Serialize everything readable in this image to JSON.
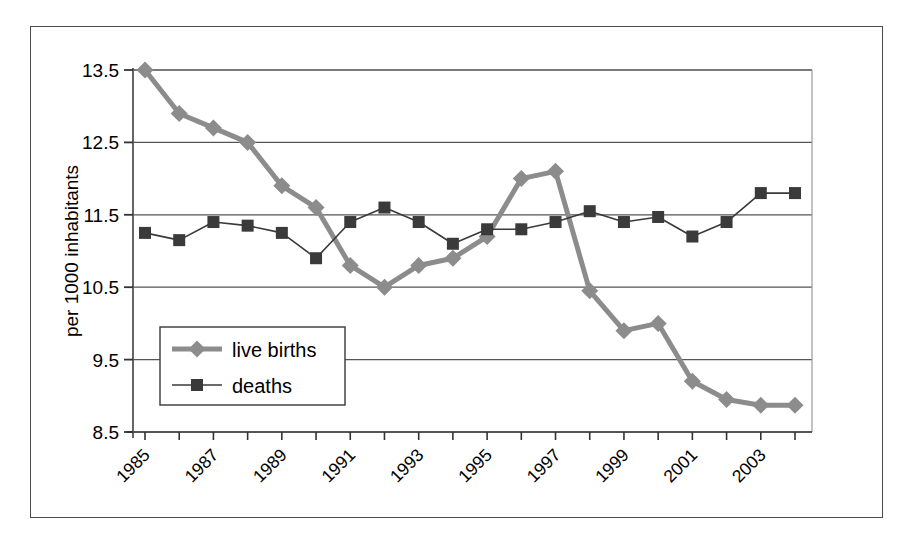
{
  "chart_data": {
    "type": "line",
    "title": "",
    "xlabel": "",
    "ylabel": "per 1000 inhabitants",
    "ylim": [
      8.5,
      13.5
    ],
    "yticks": [
      "13.5",
      "12.5",
      "11.5",
      "10.5",
      "9.5",
      "8.5"
    ],
    "ytick_values": [
      13.5,
      12.5,
      11.5,
      10.5,
      9.5,
      8.5
    ],
    "grid": true,
    "legend_position": "inside lower-left",
    "x": [
      1985,
      1986,
      1987,
      1988,
      1989,
      1990,
      1991,
      1992,
      1993,
      1994,
      1995,
      1996,
      1997,
      1998,
      1999,
      2000,
      2001,
      2002,
      2003,
      2004
    ],
    "xtick_labels": [
      "1985",
      "",
      "1987",
      "",
      "1989",
      "",
      "1991",
      "",
      "1993",
      "",
      "1995",
      "",
      "1997",
      "",
      "1999",
      "",
      "2001",
      "",
      "2003",
      ""
    ],
    "xticks_shown": [
      "1985",
      "1987",
      "1989",
      "1991",
      "1993",
      "1995",
      "1997",
      "1999",
      "2001",
      "2003"
    ],
    "series": [
      {
        "name": "live births",
        "color": "#8c8c8c",
        "marker": "diamond",
        "linewidth": 5,
        "values": [
          13.5,
          12.9,
          12.7,
          12.5,
          11.9,
          11.6,
          10.8,
          10.5,
          10.8,
          10.9,
          11.2,
          12.0,
          12.1,
          10.45,
          9.9,
          10.0,
          9.2,
          8.95,
          8.87,
          8.87
        ]
      },
      {
        "name": "deaths",
        "color": "#3a3a3a",
        "marker": "square",
        "linewidth": 1.6,
        "values": [
          11.25,
          11.15,
          11.4,
          11.35,
          11.25,
          10.9,
          11.4,
          11.6,
          11.4,
          11.1,
          11.3,
          11.3,
          11.4,
          11.55,
          11.4,
          11.47,
          11.2,
          11.4,
          11.8,
          11.8
        ]
      }
    ]
  },
  "legend": {
    "items": [
      {
        "label": "live births"
      },
      {
        "label": "deaths"
      }
    ]
  },
  "axis": {
    "y_title": "per 1000 inhabitants"
  },
  "colors": {
    "live_births": "#8c8c8c",
    "deaths": "#3a3a3a",
    "grid": "#555555",
    "frame": "#4a4a4a",
    "background": "#ffffff"
  }
}
